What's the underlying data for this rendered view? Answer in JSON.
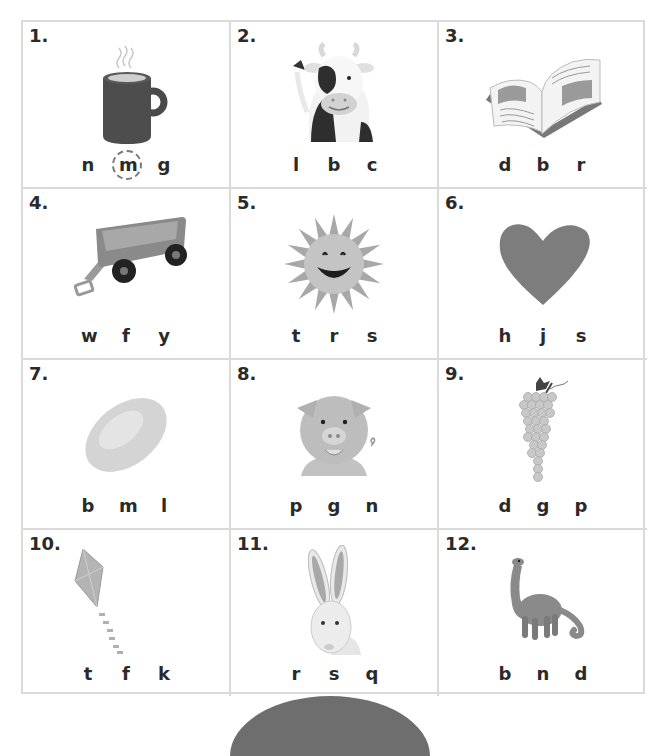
{
  "worksheet": {
    "items": [
      {
        "number": "1.",
        "picture": "mug-icon",
        "letters": [
          "n",
          "m",
          "g"
        ],
        "circled_index": 1
      },
      {
        "number": "2.",
        "picture": "cow-icon",
        "letters": [
          "l",
          "b",
          "c"
        ],
        "circled_index": null
      },
      {
        "number": "3.",
        "picture": "book-icon",
        "letters": [
          "d",
          "b",
          "r"
        ],
        "circled_index": null
      },
      {
        "number": "4.",
        "picture": "wagon-icon",
        "letters": [
          "w",
          "f",
          "y"
        ],
        "circled_index": null
      },
      {
        "number": "5.",
        "picture": "sun-icon",
        "letters": [
          "t",
          "r",
          "s"
        ],
        "circled_index": null
      },
      {
        "number": "6.",
        "picture": "heart-icon",
        "letters": [
          "h",
          "j",
          "s"
        ],
        "circled_index": null
      },
      {
        "number": "7.",
        "picture": "lemon-icon",
        "letters": [
          "b",
          "m",
          "l"
        ],
        "circled_index": null
      },
      {
        "number": "8.",
        "picture": "pig-icon",
        "letters": [
          "p",
          "g",
          "n"
        ],
        "circled_index": null
      },
      {
        "number": "9.",
        "picture": "grapes-icon",
        "letters": [
          "d",
          "g",
          "p"
        ],
        "circled_index": null
      },
      {
        "number": "10.",
        "picture": "kite-icon",
        "letters": [
          "t",
          "f",
          "k"
        ],
        "circled_index": null
      },
      {
        "number": "11.",
        "picture": "rabbit-icon",
        "letters": [
          "r",
          "s",
          "q"
        ],
        "circled_index": null
      },
      {
        "number": "12.",
        "picture": "dinosaur-icon",
        "letters": [
          "b",
          "n",
          "d"
        ],
        "circled_index": null
      }
    ]
  },
  "colors": {
    "grid_line": "#dadada",
    "text": "#2a2a2a",
    "circle": "#7a7a7a"
  }
}
